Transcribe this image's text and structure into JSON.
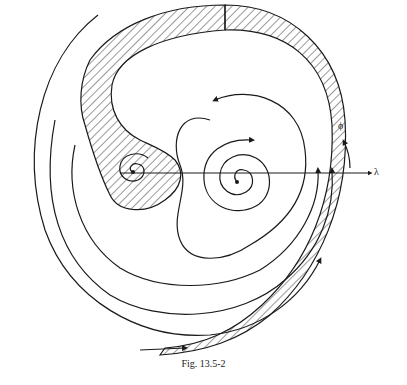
{
  "figure": {
    "caption": "Fig. 13.5-2",
    "axis_label_lambda": "λ",
    "axis_label_phi": "ϕ",
    "colors": {
      "ink": "#1a1a1a",
      "hatch": "#333333",
      "background": "#ffffff"
    }
  }
}
